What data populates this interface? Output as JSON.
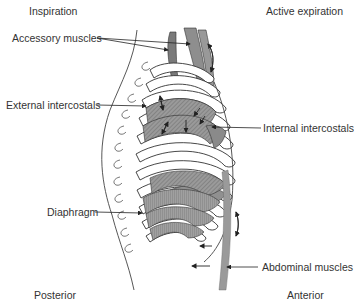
{
  "diagram": {
    "corner_labels": {
      "top_left": "Inspiration",
      "top_right": "Active expiration",
      "bottom_left": "Posterior",
      "bottom_right": "Anterior"
    },
    "callouts": [
      {
        "id": "accessory",
        "label": "Accessory muscles"
      },
      {
        "id": "external",
        "label": "External intercostals"
      },
      {
        "id": "internal",
        "label": "Internal intercostals"
      },
      {
        "id": "diaphragm",
        "label": "Diaphragm"
      },
      {
        "id": "abdominal",
        "label": "Abdominal muscles"
      }
    ],
    "colors": {
      "muscle_fill": "#8a8a8a",
      "muscle_light": "#a5a5a5",
      "outline": "#333333",
      "text": "#333333"
    }
  }
}
